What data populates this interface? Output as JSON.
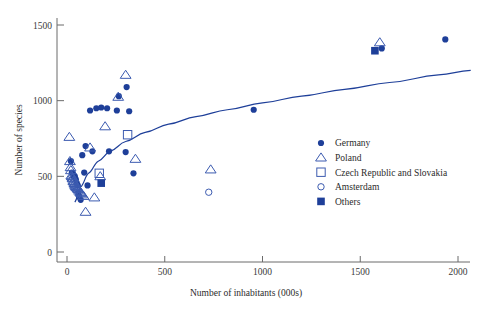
{
  "chart_data": {
    "type": "scatter",
    "title": "",
    "xlabel": "Number of inhabitants (000s)",
    "ylabel": "Number of species",
    "xlim": [
      0,
      2100
    ],
    "ylim": [
      0,
      1560
    ],
    "xticks": [
      0,
      500,
      1000,
      1500,
      2000
    ],
    "xticklabels": [
      "0",
      "500",
      "1000",
      "1500",
      "2000"
    ],
    "yticks": [
      0,
      500,
      1000,
      1500
    ],
    "yticklabels": [
      "0",
      "500",
      "1000",
      "1500"
    ],
    "grid": false,
    "legend_position": "right",
    "marker_color": "#1e3f99",
    "open_marker_color": "#3c5bb0",
    "curve_color": "#1e3f99",
    "legend": [
      {
        "label": "Germany",
        "marker": "filled-circle"
      },
      {
        "label": "Poland",
        "marker": "open-triangle"
      },
      {
        "label": "Czech Republic and Slovakia",
        "marker": "open-square"
      },
      {
        "label": "Amsterdam",
        "marker": "open-circle"
      },
      {
        "label": "Others",
        "marker": "filled-square"
      }
    ],
    "series": [
      {
        "name": "Germany",
        "marker": "filled-circle",
        "points": [
          [
            20,
            600
          ],
          [
            25,
            525
          ],
          [
            30,
            520
          ],
          [
            35,
            500
          ],
          [
            40,
            500
          ],
          [
            45,
            480
          ],
          [
            50,
            455
          ],
          [
            55,
            440
          ],
          [
            58,
            390
          ],
          [
            62,
            365
          ],
          [
            70,
            345
          ],
          [
            78,
            640
          ],
          [
            88,
            525
          ],
          [
            95,
            700
          ],
          [
            105,
            440
          ],
          [
            118,
            935
          ],
          [
            130,
            665
          ],
          [
            150,
            950
          ],
          [
            175,
            955
          ],
          [
            205,
            950
          ],
          [
            215,
            665
          ],
          [
            255,
            935
          ],
          [
            265,
            1030
          ],
          [
            300,
            660
          ],
          [
            305,
            1090
          ],
          [
            318,
            930
          ],
          [
            340,
            520
          ],
          [
            955,
            940
          ],
          [
            1610,
            1345
          ],
          [
            1935,
            1405
          ]
        ]
      },
      {
        "name": "Poland",
        "marker": "open-triangle",
        "points": [
          [
            12,
            760
          ],
          [
            15,
            600
          ],
          [
            18,
            560
          ],
          [
            20,
            540
          ],
          [
            22,
            505
          ],
          [
            25,
            500
          ],
          [
            28,
            490
          ],
          [
            30,
            485
          ],
          [
            32,
            470
          ],
          [
            35,
            465
          ],
          [
            38,
            455
          ],
          [
            40,
            450
          ],
          [
            42,
            440
          ],
          [
            45,
            435
          ],
          [
            48,
            430
          ],
          [
            52,
            425
          ],
          [
            55,
            420
          ],
          [
            58,
            415
          ],
          [
            62,
            405
          ],
          [
            68,
            395
          ],
          [
            72,
            390
          ],
          [
            78,
            380
          ],
          [
            85,
            370
          ],
          [
            95,
            265
          ],
          [
            118,
            690
          ],
          [
            140,
            360
          ],
          [
            170,
            500
          ],
          [
            195,
            830
          ],
          [
            262,
            1025
          ],
          [
            300,
            1170
          ],
          [
            350,
            615
          ],
          [
            735,
            545
          ],
          [
            1600,
            1385
          ]
        ]
      },
      {
        "name": "Czech Republic and Slovakia",
        "marker": "open-square",
        "points": [
          [
            165,
            520
          ],
          [
            310,
            775
          ]
        ]
      },
      {
        "name": "Amsterdam",
        "marker": "open-circle",
        "points": [
          [
            725,
            395
          ]
        ]
      },
      {
        "name": "Others",
        "marker": "filled-square",
        "points": [
          [
            175,
            455
          ],
          [
            1575,
            1330
          ]
        ]
      }
    ],
    "fit_curve": {
      "description": "logarithmic trend line",
      "points": [
        [
          40,
          330
        ],
        [
          70,
          430
        ],
        [
          110,
          520
        ],
        [
          160,
          600
        ],
        [
          220,
          665
        ],
        [
          300,
          730
        ],
        [
          400,
          790
        ],
        [
          520,
          845
        ],
        [
          660,
          895
        ],
        [
          820,
          940
        ],
        [
          1000,
          985
        ],
        [
          1200,
          1030
        ],
        [
          1420,
          1075
        ],
        [
          1650,
          1120
        ],
        [
          1900,
          1170
        ],
        [
          2065,
          1200
        ]
      ]
    }
  }
}
